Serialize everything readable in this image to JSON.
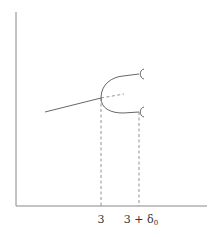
{
  "diagram": {
    "type": "bifurcation-diagram",
    "colors": {
      "axis": "#888888",
      "curve": "#555555",
      "dashed": "#777777"
    },
    "x_axis": {
      "label": ""
    },
    "y_axis": {
      "label": ""
    },
    "tick_labels": [
      {
        "text": "3",
        "x": 101
      },
      {
        "text": "3 + δ",
        "subscript": "0",
        "x": 139
      }
    ],
    "elements": {
      "incoming_branch": "solid line approaching bifurcation point",
      "continuation": "dashed line continuing past bifurcation",
      "upper_branch": "solid upper fold branch",
      "lower_branch": "solid lower fold branch",
      "branch_end_markers": 2,
      "vertical_guides": 2
    }
  }
}
